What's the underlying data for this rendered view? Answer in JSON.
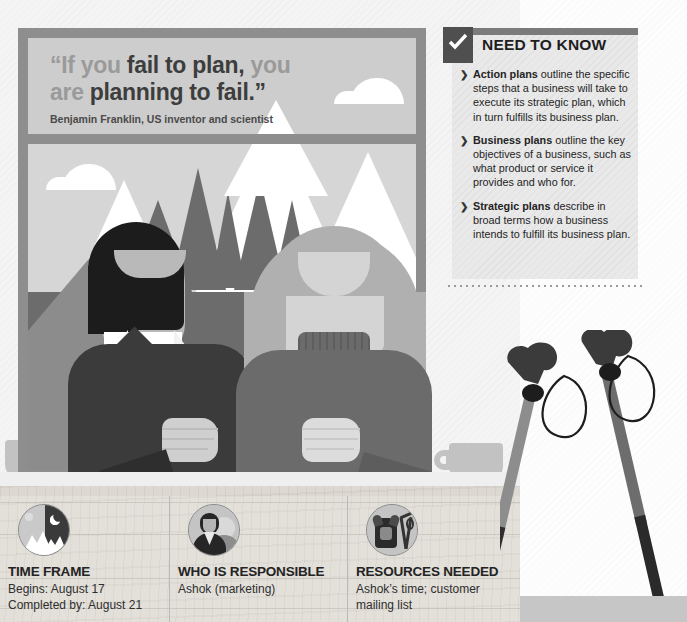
{
  "poster": {
    "quote_line1_a": "“If you ",
    "quote_line1_b": "fail to plan,",
    "quote_line1_c": " you",
    "quote_line2_a": "are ",
    "quote_line2_b": "planning to fail.”",
    "attribution": "Benjamin Franklin, US inventor and scientist"
  },
  "need_to_know": {
    "title": "NEED TO KNOW",
    "check_icon": "check-icon",
    "items": [
      {
        "lead": "Action plans",
        "rest": " outline the specific steps that a business will take to execute its strategic plan, which in turn fulfills its business plan."
      },
      {
        "lead": "Business plans",
        "rest": " outline the key objectives of a business, such as what product or service it provides and who for."
      },
      {
        "lead": "Strategic plans",
        "rest": " describe in broad terms how a business intends to fulfill its business plan."
      }
    ]
  },
  "cards": [
    {
      "icon": "mountain-day-night-icon",
      "title": "TIME FRAME",
      "line1": "Begins: August 17",
      "line2": "Completed by: August 21"
    },
    {
      "icon": "two-people-icon",
      "title": "WHO IS RESPONSIBLE",
      "line1": "Ashok (marketing)",
      "line2": ""
    },
    {
      "icon": "backpack-poles-icon",
      "title": "RESOURCES NEEDED",
      "line1": "Ashok’s time; customer",
      "line2": "mailing list"
    }
  ],
  "illustration": {
    "scene_name": "two-people-at-desk-with-mountain-poster",
    "objects": [
      "poster-frame",
      "mountain-range",
      "cloud",
      "man",
      "woman",
      "coffee-cup-left",
      "coffee-cup-right",
      "trekking-poles",
      "wooden-desk"
    ]
  },
  "colors": {
    "frame": "#8e8e8e",
    "poster_bg": "#cdcdcd",
    "sky": "#d6d6d6",
    "mountain_dark": "#6e6e6e",
    "mountain_mid": "#9a9a9a",
    "snow": "#ffffff",
    "dark_text": "#1e1e1e",
    "gray_text": "#9a9a9a",
    "panel_bg": "#e9e9e9",
    "accent_dark": "#4f4f4f",
    "wood": "#ddd9d2"
  }
}
